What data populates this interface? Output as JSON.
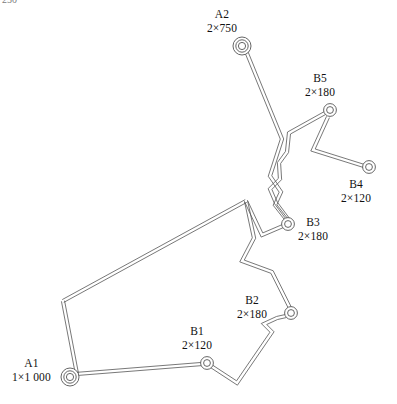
{
  "figure": {
    "type": "single-line-cable-route-diagram",
    "corner_note": "250",
    "bottom_caption": "",
    "background_color": "#ffffff",
    "line_color": "#555555",
    "text_color": "#111111"
  },
  "nodes": [
    {
      "id": "A2",
      "name": "A2",
      "rating": "2×750",
      "symbol": "substation-triple-ring-icon",
      "rings": 3,
      "x": 242,
      "y": 46,
      "label_left": 207,
      "label_top": 8
    },
    {
      "id": "B5",
      "name": "B5",
      "rating": "2×180",
      "symbol": "substation-double-ring-icon",
      "rings": 2,
      "x": 330,
      "y": 110,
      "label_left": 305,
      "label_top": 72
    },
    {
      "id": "B4",
      "name": "B4",
      "rating": "2×120",
      "symbol": "substation-double-ring-icon",
      "rings": 2,
      "x": 369,
      "y": 167,
      "label_left": 341,
      "label_top": 178
    },
    {
      "id": "B3",
      "name": "B3",
      "rating": "2×180",
      "symbol": "substation-double-ring-icon",
      "rings": 2,
      "x": 288,
      "y": 224,
      "label_left": 298,
      "label_top": 216
    },
    {
      "id": "B2",
      "name": "B2",
      "rating": "2×180",
      "symbol": "substation-double-ring-icon",
      "rings": 2,
      "x": 291,
      "y": 313,
      "label_left": 237,
      "label_top": 294
    },
    {
      "id": "B1",
      "name": "B1",
      "rating": "2×120",
      "symbol": "substation-double-ring-icon",
      "rings": 2,
      "x": 207,
      "y": 363,
      "label_left": 182,
      "label_top": 325
    },
    {
      "id": "A1",
      "name": "A1",
      "rating": "1×1 000",
      "symbol": "substation-triple-ring-icon",
      "rings": 3,
      "x": 70,
      "y": 377,
      "label_left": 12,
      "label_top": 357
    }
  ],
  "routes": [
    {
      "id": "route-a2-b3",
      "from": "A2",
      "to": "B3",
      "style": "double-line",
      "points": "246,51 282,139 270,176 281,192 275,205 286,219"
    },
    {
      "id": "route-b5-b3",
      "from": "B5",
      "to": "B3",
      "style": "double-line",
      "points": "325,113 289,133 287,152 279,163 280,179 270,189 276,203 288,219"
    },
    {
      "id": "route-b5-b4",
      "from": "B5",
      "to": "B4",
      "style": "double-line",
      "points": "328,117 313,150 364,166"
    },
    {
      "id": "route-b3-apex",
      "from": "B3",
      "to": "polygon-apex",
      "style": "double-line",
      "points": "283,226 262,235 246,201"
    },
    {
      "id": "route-apex-corner",
      "from": "polygon-apex",
      "to": "polygon-corner-left",
      "style": "double-line",
      "points": "246,201 63,301"
    },
    {
      "id": "route-corner-a1",
      "from": "polygon-corner-left",
      "to": "A1",
      "style": "double-line",
      "points": "63,301 77,374"
    },
    {
      "id": "route-a1-b1",
      "from": "A1",
      "to": "B1",
      "style": "double-line",
      "points": "76,374 202,364"
    },
    {
      "id": "route-b1-b2",
      "from": "B1",
      "to": "B2",
      "style": "double-line",
      "points": "211,366 237,383 272,332 264,324 277,318 286,316"
    },
    {
      "id": "route-b2-apex",
      "from": "B2",
      "to": "polygon-apex",
      "style": "double-line",
      "points": "290,308 272,272 242,261 254,238 246,201"
    }
  ]
}
